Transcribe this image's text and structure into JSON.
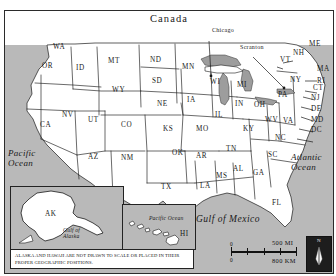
{
  "map": {
    "title": "United States Reference Map",
    "countries": [
      {
        "name": "Canada",
        "x": 150,
        "y": 14
      },
      {
        "name": "Mexico",
        "x": 104,
        "y": 203
      }
    ],
    "oceans": [
      {
        "name_line1": "Pacific",
        "name_line2": "Ocean",
        "x": 8,
        "y": 148
      },
      {
        "name_line1": "Atlantic",
        "name_line2": "Ocean",
        "x": 291,
        "y": 152
      },
      {
        "name": "Gulf of Mexico",
        "x": 196,
        "y": 215
      }
    ],
    "cities": [
      {
        "name": "Chicago",
        "x": 212,
        "y": 27,
        "dot_x": 207,
        "dot_y": 66
      },
      {
        "name": "Scranton",
        "x": 240,
        "y": 44,
        "dot_x": 279,
        "dot_y": 76
      }
    ],
    "states": [
      {
        "abbr": "WA",
        "x": 53,
        "y": 44
      },
      {
        "abbr": "OR",
        "x": 42,
        "y": 63
      },
      {
        "abbr": "ID",
        "x": 76,
        "y": 65
      },
      {
        "abbr": "MT",
        "x": 108,
        "y": 58
      },
      {
        "abbr": "ND",
        "x": 150,
        "y": 57
      },
      {
        "abbr": "SD",
        "x": 152,
        "y": 78
      },
      {
        "abbr": "WY",
        "x": 112,
        "y": 87
      },
      {
        "abbr": "NE",
        "x": 157,
        "y": 101
      },
      {
        "abbr": "NV",
        "x": 62,
        "y": 112
      },
      {
        "abbr": "UT",
        "x": 88,
        "y": 117
      },
      {
        "abbr": "CO",
        "x": 121,
        "y": 122
      },
      {
        "abbr": "KS",
        "x": 163,
        "y": 126
      },
      {
        "abbr": "CA",
        "x": 40,
        "y": 122
      },
      {
        "abbr": "MN",
        "x": 182,
        "y": 64
      },
      {
        "abbr": "IA",
        "x": 187,
        "y": 97
      },
      {
        "abbr": "MO",
        "x": 196,
        "y": 126
      },
      {
        "abbr": "WI",
        "x": 210,
        "y": 79
      },
      {
        "abbr": "MI",
        "x": 237,
        "y": 82
      },
      {
        "abbr": "IL",
        "x": 215,
        "y": 112
      },
      {
        "abbr": "IN",
        "x": 235,
        "y": 101
      },
      {
        "abbr": "OH",
        "x": 254,
        "y": 102
      },
      {
        "abbr": "KY",
        "x": 243,
        "y": 126
      },
      {
        "abbr": "AZ",
        "x": 88,
        "y": 154
      },
      {
        "abbr": "NM",
        "x": 121,
        "y": 155
      },
      {
        "abbr": "OK",
        "x": 172,
        "y": 150
      },
      {
        "abbr": "AR",
        "x": 196,
        "y": 153
      },
      {
        "abbr": "TN",
        "x": 226,
        "y": 146
      },
      {
        "abbr": "TX",
        "x": 161,
        "y": 184
      },
      {
        "abbr": "LA",
        "x": 200,
        "y": 183
      },
      {
        "abbr": "MS",
        "x": 216,
        "y": 173
      },
      {
        "abbr": "AL",
        "x": 233,
        "y": 166
      },
      {
        "abbr": "GA",
        "x": 253,
        "y": 170
      },
      {
        "abbr": "FL",
        "x": 272,
        "y": 200
      },
      {
        "abbr": "SC",
        "x": 268,
        "y": 152
      },
      {
        "abbr": "NC",
        "x": 275,
        "y": 135
      },
      {
        "abbr": "VA",
        "x": 283,
        "y": 118
      },
      {
        "abbr": "WV",
        "x": 265,
        "y": 117
      },
      {
        "abbr": "PA",
        "x": 278,
        "y": 92
      },
      {
        "abbr": "NY",
        "x": 290,
        "y": 77
      },
      {
        "abbr": "VT",
        "x": 280,
        "y": 57
      },
      {
        "abbr": "NH",
        "x": 293,
        "y": 50
      },
      {
        "abbr": "ME",
        "x": 309,
        "y": 41
      }
    ],
    "callout_states": [
      {
        "abbr": "MA",
        "x": 317,
        "y": 69
      },
      {
        "abbr": "RI",
        "x": 317,
        "y": 81
      },
      {
        "abbr": "CT",
        "x": 313,
        "y": 88
      },
      {
        "abbr": "NJ",
        "x": 311,
        "y": 98
      },
      {
        "abbr": "DE",
        "x": 311,
        "y": 109
      },
      {
        "abbr": "MD",
        "x": 311,
        "y": 120
      },
      {
        "abbr": "DC",
        "x": 311,
        "y": 130
      }
    ],
    "insets": {
      "alaska": {
        "label": "AK",
        "water_label_line1": "Gulf of",
        "water_label_line2": "Alaska"
      },
      "hawaii": {
        "label": "HI",
        "water_label": "Pacific Ocean"
      },
      "caption": "ALASKA AND HAWAII ARE NOT DRAWN TO SCALE OR PLACED IN THEIR PROPER GEOGRAPHIC POSITIONS."
    },
    "scale": {
      "zero_miles": "0",
      "zero_km": "0",
      "miles_label": "500 MI",
      "km_label": "800 KM"
    },
    "compass": {
      "north_label": "N"
    },
    "colors": {
      "water": "#b9b9b9",
      "land": "#ffffff",
      "border": "#1a1a1a",
      "lakes": "#9d9d9d"
    }
  }
}
